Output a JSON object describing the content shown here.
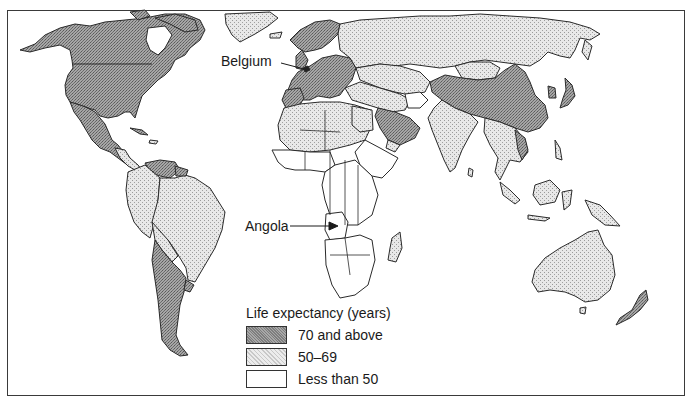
{
  "map": {
    "title": "World life expectancy",
    "callouts": [
      {
        "id": "belgium",
        "label": "Belgium",
        "category": "70 and above"
      },
      {
        "id": "angola",
        "label": "Angola",
        "category": "Less than 50"
      }
    ]
  },
  "legend": {
    "title": "Life expectancy (years)",
    "items": [
      {
        "label": "70 and above",
        "fill": "#8c8c8c",
        "pattern": "dense-stipple"
      },
      {
        "label": "50–69",
        "fill": "#d6d6d6",
        "pattern": "light-stipple"
      },
      {
        "label": "Less than 50",
        "fill": "#ffffff",
        "pattern": "none"
      }
    ]
  },
  "colors": {
    "high": "#9a9a9a",
    "medium": "#dcdcdc",
    "low": "#ffffff",
    "outline": "#2a2a2a"
  },
  "regions": {
    "high": [
      "North America",
      "Mexico",
      "Europe",
      "Argentina",
      "Uruguay",
      "Chile",
      "Saudi Arabia",
      "China",
      "Japan",
      "Cuba",
      "Venezuela",
      "Guyana"
    ],
    "medium": [
      "Russia",
      "Brazil",
      "Greenland",
      "India",
      "Central Asia",
      "Middle East",
      "North Africa",
      "Australia",
      "New Zealand",
      "Southeast Asia",
      "Indonesia",
      "Papua New Guinea",
      "Madagascar",
      "Mongolia"
    ],
    "low": [
      "Sub-Saharan Africa",
      "Angola",
      "Afghanistan"
    ]
  }
}
